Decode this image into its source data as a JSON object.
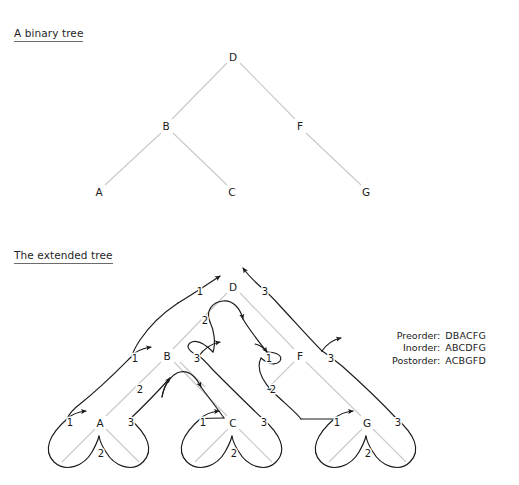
{
  "figure": {
    "binary_tree_caption": "A binary tree",
    "extended_tree_caption": "The extended tree"
  },
  "traversals": {
    "rows": [
      {
        "label": "Preorder:",
        "value": "DBACFG"
      },
      {
        "label": "Inorder:",
        "value": "ABCDFG"
      },
      {
        "label": "Postorder:",
        "value": "ACBGFD"
      }
    ]
  },
  "colors": {
    "background": "#ffffff",
    "tree_edge": "#c9c9c9",
    "tour_curve": "#1a1a1a",
    "node_label": "#1a1a1a",
    "caption_rule": "#6b6b6b"
  },
  "binary_tree": {
    "nodes": [
      {
        "id": "D",
        "label": "D",
        "x": 233,
        "y": 57
      },
      {
        "id": "B",
        "label": "B",
        "x": 166,
        "y": 126
      },
      {
        "id": "F",
        "label": "F",
        "x": 300,
        "y": 126
      },
      {
        "id": "A",
        "label": "A",
        "x": 99,
        "y": 192
      },
      {
        "id": "C",
        "label": "C",
        "x": 232,
        "y": 192
      },
      {
        "id": "G",
        "label": "G",
        "x": 366,
        "y": 192
      }
    ],
    "edges": [
      {
        "from": "D",
        "to": "B"
      },
      {
        "from": "D",
        "to": "F"
      },
      {
        "from": "B",
        "to": "A"
      },
      {
        "from": "B",
        "to": "C"
      },
      {
        "from": "F",
        "to": "G"
      }
    ]
  },
  "extended_tree": {
    "nodes": [
      {
        "id": "D",
        "label": "D",
        "x": 233,
        "y": 287
      },
      {
        "id": "B",
        "label": "B",
        "x": 167,
        "y": 356
      },
      {
        "id": "F",
        "label": "F",
        "x": 300,
        "y": 356
      },
      {
        "id": "A",
        "label": "A",
        "x": 100,
        "y": 423
      },
      {
        "id": "C",
        "label": "C",
        "x": 233,
        "y": 423
      },
      {
        "id": "G",
        "label": "G",
        "x": 367,
        "y": 423
      }
    ],
    "edges": [
      {
        "from": "D",
        "to": "B"
      },
      {
        "from": "D",
        "to": "F"
      },
      {
        "from": "B",
        "to": "A"
      },
      {
        "from": "B",
        "to": "C"
      },
      {
        "from": "F",
        "to": "G"
      }
    ],
    "visit_numbers": [
      {
        "node": "D",
        "visit": "1",
        "x": 200,
        "y": 291
      },
      {
        "node": "D",
        "visit": "2",
        "x": 205,
        "y": 320
      },
      {
        "node": "D",
        "visit": "3",
        "x": 265,
        "y": 291
      },
      {
        "node": "B",
        "visit": "1",
        "x": 135,
        "y": 358
      },
      {
        "node": "B",
        "visit": "2",
        "x": 140,
        "y": 389
      },
      {
        "node": "B",
        "visit": "3",
        "x": 197,
        "y": 358
      },
      {
        "node": "F",
        "visit": "1",
        "x": 269,
        "y": 358
      },
      {
        "node": "F",
        "visit": "2",
        "x": 273,
        "y": 389
      },
      {
        "node": "F",
        "visit": "3",
        "x": 331,
        "y": 358
      },
      {
        "node": "A",
        "visit": "1",
        "x": 70,
        "y": 422
      },
      {
        "node": "A",
        "visit": "2",
        "x": 101,
        "y": 453
      },
      {
        "node": "A",
        "visit": "3",
        "x": 131,
        "y": 422
      },
      {
        "node": "C",
        "visit": "1",
        "x": 203,
        "y": 422
      },
      {
        "node": "C",
        "visit": "2",
        "x": 234,
        "y": 453
      },
      {
        "node": "C",
        "visit": "3",
        "x": 264,
        "y": 422
      },
      {
        "node": "G",
        "visit": "1",
        "x": 337,
        "y": 422
      },
      {
        "node": "G",
        "visit": "2",
        "x": 368,
        "y": 453
      },
      {
        "node": "G",
        "visit": "3",
        "x": 398,
        "y": 422
      }
    ]
  }
}
